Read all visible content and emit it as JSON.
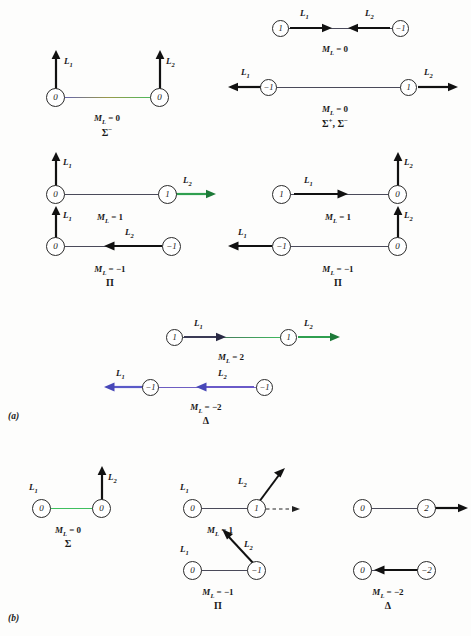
{
  "figure": {
    "panels": [
      {
        "label": "(a)"
      },
      {
        "label": "(b)"
      }
    ]
  },
  "labels": {
    "L1": "L",
    "L2": "L",
    "sub1": "1",
    "sub2": "2",
    "ML": "M",
    "ML_sub": "L"
  },
  "diagrams": {
    "a1": {
      "left_node": "0",
      "right_node": "0",
      "l1": "L",
      "l1_sub": "1",
      "l2": "L",
      "l2_sub": "2",
      "ml": "= 0",
      "term": "Σ−"
    },
    "a2": {
      "left_node": "1",
      "right_node": "−1",
      "l1": "L",
      "l1_sub": "1",
      "l2": "L",
      "l2_sub": "2",
      "ml": "= 0",
      "term": ""
    },
    "a3": {
      "left_node": "−1",
      "right_node": "1",
      "l1": "L",
      "l1_sub": "1",
      "l2": "L",
      "l2_sub": "2",
      "ml": "= 0",
      "term": "Σ+, Σ−"
    },
    "a4": {
      "left_node": "0",
      "right_node": "1",
      "l1": "L",
      "l1_sub": "1",
      "l2": "L",
      "l2_sub": "2",
      "ml": "= 1",
      "term": ""
    },
    "a5": {
      "left_node": "0",
      "right_node": "−1",
      "l1": "L",
      "l1_sub": "1",
      "l2": "L",
      "l2_sub": "2",
      "ml": "= −1",
      "term": "Π"
    },
    "a6": {
      "left_node": "1",
      "right_node": "0",
      "l1": "L",
      "l1_sub": "1",
      "l2": "L",
      "l2_sub": "2",
      "ml": "= 1",
      "term": ""
    },
    "a7": {
      "left_node": "−1",
      "right_node": "0",
      "l1": "L",
      "l1_sub": "1",
      "l2": "L",
      "l2_sub": "2",
      "ml": "= −1",
      "term": "Π"
    },
    "a8": {
      "left_node": "1",
      "right_node": "1",
      "l1": "L",
      "l1_sub": "1",
      "l2": "L",
      "l2_sub": "2",
      "ml": "= 2",
      "term": ""
    },
    "a9": {
      "left_node": "−1",
      "right_node": "−1",
      "l1": "L",
      "l1_sub": "1",
      "l2": "L",
      "l2_sub": "2",
      "ml": "= −2",
      "term": "Δ"
    },
    "b1": {
      "left_node": "0",
      "right_node": "0",
      "l1": "L",
      "l1_sub": "1",
      "l2": "L",
      "l2_sub": "2",
      "ml": "= 0",
      "term": "Σ"
    },
    "b2": {
      "left_node": "0",
      "right_node": "1",
      "l1": "L",
      "l1_sub": "1",
      "l2": "L",
      "l2_sub": "2",
      "ml": "= 1",
      "term": ""
    },
    "b3": {
      "left_node": "0",
      "right_node": "−1",
      "l1": "L",
      "l1_sub": "1",
      "l2": "L",
      "l2_sub": "2",
      "ml": "= −1",
      "term": "Π"
    },
    "b4": {
      "left_node": "0",
      "right_node": "2",
      "l1": "",
      "l1_sub": "",
      "l2": "",
      "l2_sub": "",
      "ml": "",
      "term": ""
    },
    "b5": {
      "left_node": "0",
      "right_node": "−2",
      "l1": "",
      "l1_sub": "",
      "l2": "",
      "l2_sub": "",
      "ml": "= −2",
      "term": "Δ"
    }
  }
}
